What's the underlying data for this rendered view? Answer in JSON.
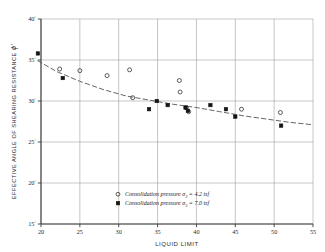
{
  "figure": {
    "title": "",
    "xaxis_title": "LIQUID LIMIT",
    "yaxis_title": "EFFECTIVE ANGLE OF SHEARING RESISTANCE",
    "yaxis_symbol": "ϕ'",
    "x_ticks": [
      "20",
      "25",
      "30",
      "35",
      "40",
      "45",
      "50",
      "55"
    ],
    "y_ticks": [
      "40",
      "35",
      "30",
      "25",
      "20",
      "15"
    ],
    "degree_sign": "°"
  },
  "legend": {
    "position": "inside-bottom-center",
    "entries": [
      {
        "marker": "open-circle",
        "text": "Consolidation pressure σ",
        "sub": "3",
        "tail": " = 4.2 tsf"
      },
      {
        "marker": "filled-circle",
        "text": "Consolidation pressure σ",
        "sub": "3",
        "tail": " = 7.0 tsf"
      }
    ]
  },
  "colors": {
    "axis": "#3a3a3a",
    "grid": "#8d8d8d",
    "marker": "#141414",
    "trend": "#4a4a4a",
    "background": "#ffffff"
  },
  "chart_data": {
    "type": "scatter",
    "title": "",
    "xlabel": "LIQUID LIMIT",
    "ylabel": "EFFECTIVE ANGLE OF SHEARING RESISTANCE ϕ'",
    "xlim": [
      20,
      55
    ],
    "ylim": [
      15,
      40
    ],
    "xticks": [
      20,
      25,
      30,
      35,
      40,
      45,
      50,
      55
    ],
    "yticks": [
      15,
      20,
      25,
      30,
      35,
      40
    ],
    "grid": true,
    "series": [
      {
        "name": "Consolidation pressure σ3 = 4.2 tsf",
        "marker": "open-circle",
        "points": [
          [
            22.4,
            33.9
          ],
          [
            25.0,
            33.7
          ],
          [
            28.5,
            33.1
          ],
          [
            31.4,
            33.8
          ],
          [
            31.8,
            30.4
          ],
          [
            37.8,
            32.5
          ],
          [
            37.9,
            31.1
          ],
          [
            38.7,
            29.2
          ],
          [
            39.0,
            28.7
          ],
          [
            45.8,
            29.0
          ],
          [
            50.8,
            28.6
          ]
        ]
      },
      {
        "name": "Consolidation pressure σ3 = 7.0 tsf",
        "marker": "filled-circle",
        "points": [
          [
            19.6,
            35.8
          ],
          [
            22.8,
            32.8
          ],
          [
            33.9,
            29.0
          ],
          [
            34.9,
            30.0
          ],
          [
            36.3,
            29.5
          ],
          [
            38.6,
            29.2
          ],
          [
            38.9,
            28.8
          ],
          [
            41.8,
            29.5
          ],
          [
            43.8,
            29.0
          ],
          [
            45.0,
            28.1
          ],
          [
            50.9,
            27.0
          ]
        ]
      }
    ],
    "trend_curve": {
      "style": "dashed",
      "points": [
        [
          19.6,
          34.9
        ],
        [
          22.0,
          33.6
        ],
        [
          25.0,
          32.4
        ],
        [
          28.0,
          31.4
        ],
        [
          31.0,
          30.6
        ],
        [
          34.0,
          30.1
        ],
        [
          37.0,
          29.6
        ],
        [
          40.0,
          29.2
        ],
        [
          43.0,
          28.7
        ],
        [
          46.0,
          28.2
        ],
        [
          49.0,
          27.8
        ],
        [
          52.0,
          27.4
        ],
        [
          55.0,
          27.1
        ]
      ]
    }
  }
}
